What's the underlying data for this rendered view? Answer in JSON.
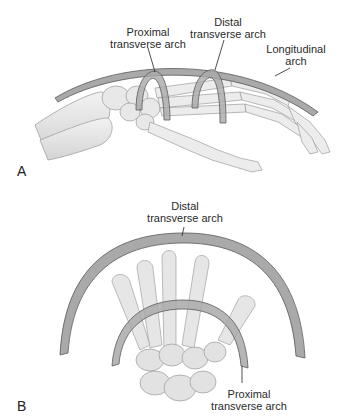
{
  "figure": {
    "panels": [
      {
        "letter": "A",
        "view": "lateral",
        "labels": {
          "proximal_line1": "Proximal",
          "proximal_line2": "transverse arch",
          "distal_line1": "Distal",
          "distal_line2": "transverse arch",
          "longitudinal_line1": "Longitudinal",
          "longitudinal_line2": "arch"
        }
      },
      {
        "letter": "B",
        "view": "end-on",
        "labels": {
          "distal_line1": "Distal",
          "distal_line2": "transverse arch",
          "proximal_line1": "Proximal",
          "proximal_line2": "transverse arch"
        }
      }
    ],
    "colors": {
      "arch_fill": "#a9a9a9",
      "arch_stroke": "#5a5a5a",
      "bone_fill": "#e6e6e6",
      "bone_stroke": "#9a9a9a",
      "text": "#2a2a2a"
    }
  }
}
